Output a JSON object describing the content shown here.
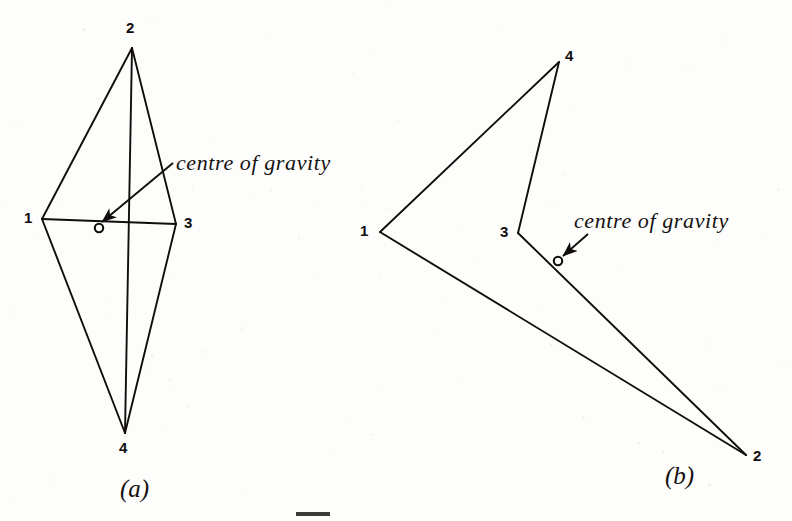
{
  "figure": {
    "background_color": "#fdfdfc",
    "ink_color": "#100d0c",
    "panels": [
      {
        "id": "a",
        "label": "(a)",
        "label_pos": [
          120,
          476
        ],
        "annotation": "centre of gravity",
        "annotation_pos": [
          176,
          152
        ],
        "vertices": [
          {
            "name": "1",
            "point": [
              42,
              219
            ],
            "label_pos": [
              24,
              210
            ]
          },
          {
            "name": "2",
            "point": [
              132,
              48
            ],
            "label_pos": [
              126,
              20
            ]
          },
          {
            "name": "3",
            "point": [
              176,
              224
            ],
            "label_pos": [
              184,
              215
            ]
          },
          {
            "name": "4",
            "point": [
              125,
              433
            ],
            "label_pos": [
              119,
              440
            ]
          }
        ],
        "centroid": {
          "name": "o",
          "point": [
            99,
            228
          ],
          "radius": 4.2
        },
        "edges": [
          [
            42,
            219,
            132,
            48
          ],
          [
            132,
            48,
            176,
            224
          ],
          [
            176,
            224,
            125,
            433
          ],
          [
            125,
            433,
            42,
            219
          ],
          [
            42,
            219,
            176,
            224
          ],
          [
            132,
            48,
            125,
            433
          ]
        ],
        "arrow": {
          "from": [
            173,
            163
          ],
          "to": [
            102,
            222
          ]
        }
      },
      {
        "id": "b",
        "label": "(b)",
        "label_pos": [
          665,
          463
        ],
        "annotation": "centre  of  gravity",
        "annotation_pos": [
          574,
          210
        ],
        "vertices": [
          {
            "name": "1",
            "point": [
              380,
              232
            ],
            "label_pos": [
              360,
              223
            ]
          },
          {
            "name": "2",
            "point": [
              746,
              455
            ],
            "label_pos": [
              753,
              448
            ]
          },
          {
            "name": "3",
            "point": [
              518,
              233
            ],
            "label_pos": [
              500,
              224
            ]
          },
          {
            "name": "4",
            "point": [
              559,
              62
            ],
            "label_pos": [
              565,
              48
            ]
          }
        ],
        "centroid": {
          "name": "o",
          "point": [
            558,
            261
          ],
          "radius": 4.2
        },
        "edges": [
          [
            380,
            232,
            559,
            62
          ],
          [
            559,
            62,
            518,
            233
          ],
          [
            518,
            233,
            746,
            455
          ],
          [
            746,
            455,
            380,
            232
          ]
        ],
        "arrow": {
          "from": [
            588,
            234
          ],
          "to": [
            563,
            256
          ]
        }
      }
    ]
  }
}
